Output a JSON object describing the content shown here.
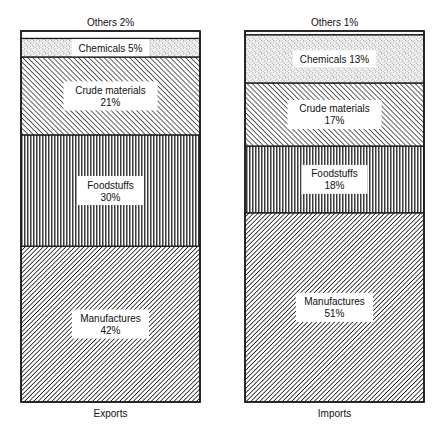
{
  "chart_data": {
    "type": "bar",
    "subtype": "stacked-100-percent",
    "title": "",
    "xlabel": "",
    "ylabel": "",
    "ylim": [
      0,
      100
    ],
    "grid": false,
    "legend": "none (labels inside segments)",
    "categories": [
      "Exports",
      "Imports"
    ],
    "series": [
      {
        "name": "Manufactures",
        "pattern": "fine-diagonal-hatch",
        "values": [
          42,
          51
        ]
      },
      {
        "name": "Foodstuffs",
        "pattern": "vertical-lines",
        "values": [
          30,
          18
        ]
      },
      {
        "name": "Crude materials",
        "pattern": "diagonal-hatch",
        "values": [
          21,
          17
        ]
      },
      {
        "name": "Chemicals",
        "pattern": "stipple",
        "values": [
          5,
          13
        ]
      },
      {
        "name": "Others",
        "pattern": "blank",
        "values": [
          2,
          1
        ]
      }
    ],
    "segment_labels": [
      [
        {
          "name": "Manufactures",
          "text": "42%"
        },
        {
          "name": "Foodstuffs",
          "text": "30%"
        },
        {
          "name": "Crude materials",
          "text": "21%"
        },
        {
          "name": "Chemicals",
          "text": "Chemicals 5%"
        },
        {
          "name": "Others",
          "text": "Others 2%"
        }
      ],
      [
        {
          "name": "Manufactures",
          "text": "51%"
        },
        {
          "name": "Foodstuffs",
          "text": "18%"
        },
        {
          "name": "Crude materials",
          "text": "17%"
        },
        {
          "name": "Chemicals",
          "text": "Chemicals 13%"
        },
        {
          "name": "Others",
          "text": "Others 1%"
        }
      ]
    ]
  },
  "colors": {
    "ink": "#1a1a1a",
    "paper": "#ffffff"
  }
}
